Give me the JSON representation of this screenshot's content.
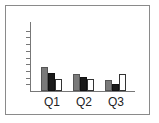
{
  "chart_data": {
    "type": "bar",
    "title": "",
    "xlabel": "",
    "ylabel": "",
    "categories": [
      "Q1",
      "Q2",
      "Q3"
    ],
    "series": [
      {
        "name": "Series 1",
        "color": "#7a7a7a",
        "values": [
          3.6,
          2.5,
          1.6
        ]
      },
      {
        "name": "Series 2",
        "color": "#1a1a1a",
        "values": [
          2.7,
          2.1,
          1.0
        ]
      },
      {
        "name": "Series 3",
        "color": "#ffffff",
        "values": [
          1.8,
          1.8,
          2.5
        ]
      }
    ],
    "ylim": [
      0,
      10
    ],
    "ytick_labels_visible": false,
    "grid": false,
    "legend": "none"
  }
}
